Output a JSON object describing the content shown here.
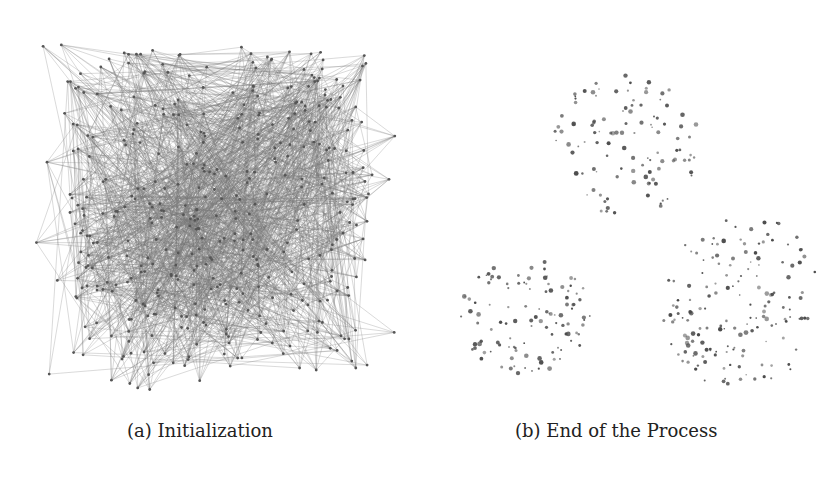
{
  "figure": {
    "panels": [
      {
        "id": "a",
        "caption": "(a) Initialization",
        "description": "Dense random graph layout: nodes scattered in a square with many crossing edges",
        "edge_color": "#7a7a7a",
        "node_color": "#555555"
      },
      {
        "id": "b",
        "caption": "(b) End of the Process",
        "description": "Clustered node layout with edges removed; three visible clusters",
        "node_color": "#4a4a4a"
      }
    ]
  }
}
